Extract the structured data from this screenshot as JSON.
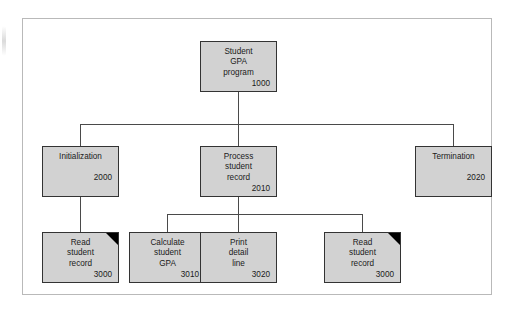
{
  "diagram": {
    "type": "structure-chart",
    "colors": {
      "module_fill": "#d2d2d2",
      "module_border": "#333333",
      "connector": "#4a4a4a",
      "frame": "#b9b9b9",
      "fold": "#000000",
      "background": "#ffffff"
    },
    "modules": [
      {
        "key": "root",
        "name": "Student\nGPA\nprogram",
        "id": "1000",
        "level": 0,
        "folded": false
      },
      {
        "key": "initialization",
        "name": "Initialization",
        "id": "2000",
        "level": 1,
        "folded": false
      },
      {
        "key": "process_student_record",
        "name": "Process\nstudent\nrecord",
        "id": "2010",
        "level": 1,
        "folded": false
      },
      {
        "key": "termination",
        "name": "Termination",
        "id": "2020",
        "level": 1,
        "folded": false
      },
      {
        "key": "read_student_record_init",
        "name": "Read\nstudent\nrecord",
        "id": "3000",
        "level": 2,
        "folded": true
      },
      {
        "key": "calculate_student_gpa",
        "name": "Calculate\nstudent\nGPA",
        "id": "3010",
        "level": 2,
        "folded": false
      },
      {
        "key": "print_detail_line",
        "name": "Print\ndetail\nline",
        "id": "3020",
        "level": 2,
        "folded": false
      },
      {
        "key": "read_student_record_process",
        "name": "Read\nstudent\nrecord",
        "id": "3000",
        "level": 2,
        "folded": true
      }
    ],
    "edges": [
      {
        "from": "root",
        "to": "initialization"
      },
      {
        "from": "root",
        "to": "process_student_record"
      },
      {
        "from": "root",
        "to": "termination"
      },
      {
        "from": "initialization",
        "to": "read_student_record_init"
      },
      {
        "from": "process_student_record",
        "to": "calculate_student_gpa"
      },
      {
        "from": "process_student_record",
        "to": "print_detail_line"
      },
      {
        "from": "process_student_record",
        "to": "read_student_record_process"
      }
    ]
  }
}
